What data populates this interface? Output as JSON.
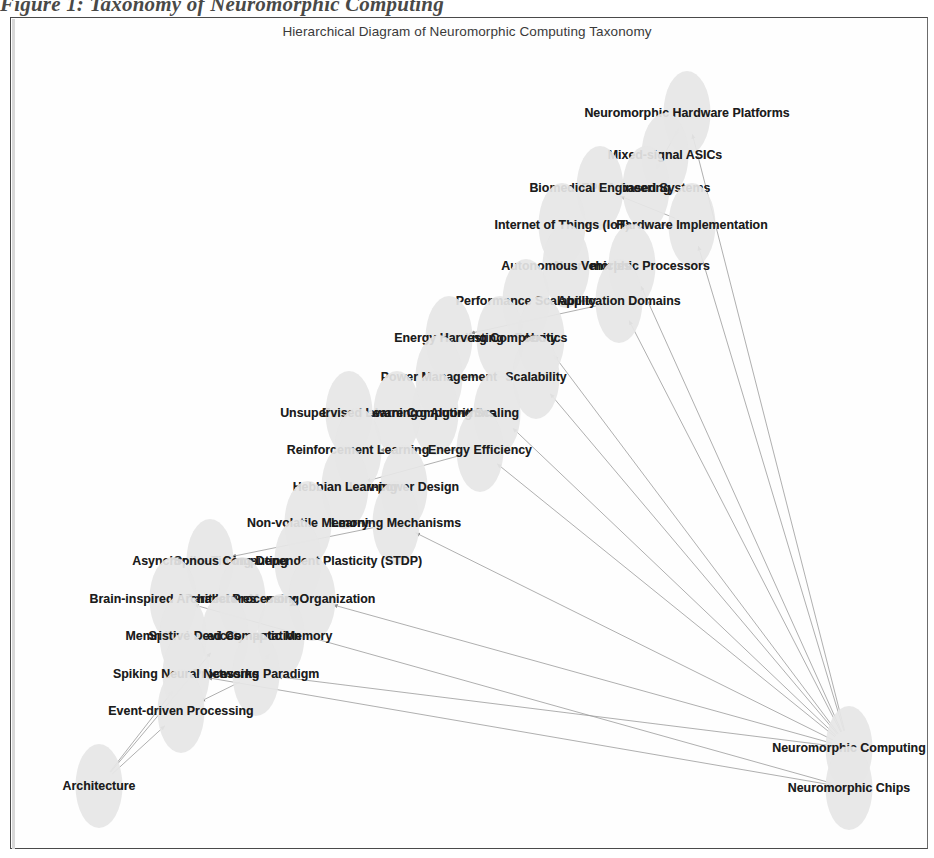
{
  "figure": {
    "caption": "Figure 1: Taxonomy of Neuromorphic Computing",
    "plot_title": "Hierarchical Diagram of Neuromorphic Computing Taxonomy"
  },
  "colors": {
    "node_fill": "#e6e6e6",
    "label_text": "#1c1c1c",
    "edge_stroke": "#9a9a9a",
    "frame_border": "#4a4a4a",
    "background": "#ffffff",
    "title_text": "#3a3a3a"
  },
  "graph": {
    "type": "hierarchical-node-link-diagram",
    "node_count": 35,
    "edge_count": 33,
    "root_nodes": [
      "Neuromorphic Computing",
      "Neuromorphic Chips",
      "Architecture"
    ],
    "nodes": [
      {
        "id": "n0",
        "label": "Neuromorphic Hardware Platforms",
        "x": 676,
        "y": 95,
        "ex": 47,
        "ey": 84
      },
      {
        "id": "n1",
        "label": "Mixed-signal ASICs",
        "x": 654,
        "y": 137,
        "ex": 47,
        "ey": 84
      },
      {
        "id": "n2",
        "label": "FPGA-based Systems",
        "x": 635,
        "y": 170,
        "ex": 47,
        "ey": 84
      },
      {
        "id": "n3",
        "label": "Biomedical Engineering",
        "x": 589,
        "y": 170,
        "ex": 47,
        "ey": 84
      },
      {
        "id": "n4",
        "label": "Hardware Implementation",
        "x": 681,
        "y": 207,
        "ex": 47,
        "ey": 84
      },
      {
        "id": "n5",
        "label": "Internet of Things (IoT)",
        "x": 551,
        "y": 207,
        "ex": 47,
        "ey": 84
      },
      {
        "id": "n6",
        "label": "Neuromorphic Processors",
        "x": 621,
        "y": 248,
        "ex": 47,
        "ey": 84
      },
      {
        "id": "n7",
        "label": "Autonomous Vehicles",
        "x": 555,
        "y": 248,
        "ex": 47,
        "ey": 84
      },
      {
        "id": "n8",
        "label": "Application Domains",
        "x": 608,
        "y": 283,
        "ex": 47,
        "ey": 84
      },
      {
        "id": "n9",
        "label": "Performance Scalability",
        "x": 515,
        "y": 283,
        "ex": 47,
        "ey": 84
      },
      {
        "id": "n10",
        "label": "Robotics",
        "x": 530,
        "y": 320,
        "ex": 47,
        "ey": 84
      },
      {
        "id": "n11",
        "label": "Scaling Complexity",
        "x": 489,
        "y": 320,
        "ex": 47,
        "ey": 84
      },
      {
        "id": "n12",
        "label": "Energy Harvesting",
        "x": 438,
        "y": 320,
        "ex": 47,
        "ey": 84
      },
      {
        "id": "n13",
        "label": "Scalability",
        "x": 525,
        "y": 359,
        "ex": 47,
        "ey": 84
      },
      {
        "id": "n14",
        "label": "Power Management",
        "x": 428,
        "y": 359,
        "ex": 47,
        "ey": 84
      },
      {
        "id": "n15",
        "label": "Scaling",
        "x": 486,
        "y": 395,
        "ex": 47,
        "ey": 84
      },
      {
        "id": "n16",
        "label": "Learning Algorithms",
        "x": 424,
        "y": 395,
        "ex": 47,
        "ey": 84
      },
      {
        "id": "n17",
        "label": "Energy-aware Computing",
        "x": 386,
        "y": 395,
        "ex": 47,
        "ey": 84
      },
      {
        "id": "n18",
        "label": "Unsupervised Learning",
        "x": 338,
        "y": 395,
        "ex": 47,
        "ey": 84
      },
      {
        "id": "n19",
        "label": "Energy Efficiency",
        "x": 469,
        "y": 432,
        "ex": 47,
        "ey": 84
      },
      {
        "id": "n20",
        "label": "Reinforcement Learning",
        "x": 347,
        "y": 432,
        "ex": 47,
        "ey": 84
      },
      {
        "id": "n21",
        "label": "Low-power Design",
        "x": 393,
        "y": 469,
        "ex": 47,
        "ey": 84
      },
      {
        "id": "n22",
        "label": "Hebbian Learning",
        "x": 334,
        "y": 469,
        "ex": 47,
        "ey": 84
      },
      {
        "id": "n23",
        "label": "Learning Mechanisms",
        "x": 385,
        "y": 505,
        "ex": 47,
        "ey": 84
      },
      {
        "id": "n24",
        "label": "Non-volatile Memory",
        "x": 297,
        "y": 505,
        "ex": 47,
        "ey": 84
      },
      {
        "id": "n25",
        "label": "Spike-Timing-Dependent Plasticity (STDP)",
        "x": 287,
        "y": 543,
        "ex": 47,
        "ey": 84
      },
      {
        "id": "n26",
        "label": "Asynchronous Computing",
        "x": 199,
        "y": 543,
        "ex": 47,
        "ey": 84
      },
      {
        "id": "n27",
        "label": "Memory Organization",
        "x": 301,
        "y": 581,
        "ex": 47,
        "ey": 84
      },
      {
        "id": "n28",
        "label": "Parallel Processing",
        "x": 231,
        "y": 581,
        "ex": 47,
        "ey": 84
      },
      {
        "id": "n29",
        "label": "Brain-inspired Architectures",
        "x": 162,
        "y": 581,
        "ex": 47,
        "ey": 84
      },
      {
        "id": "n30",
        "label": "Synaptic Memory",
        "x": 270,
        "y": 618,
        "ex": 47,
        "ey": 84
      },
      {
        "id": "n31",
        "label": "Spike-based Computation",
        "x": 214,
        "y": 618,
        "ex": 47,
        "ey": 84
      },
      {
        "id": "n32",
        "label": "Memristive Devices",
        "x": 172,
        "y": 618,
        "ex": 47,
        "ey": 84
      },
      {
        "id": "n33",
        "label": "Processing Paradigm",
        "x": 245,
        "y": 656,
        "ex": 47,
        "ey": 84
      },
      {
        "id": "n34",
        "label": "Spiking Neural Networks",
        "x": 175,
        "y": 656,
        "ex": 47,
        "ey": 84
      },
      {
        "id": "n35",
        "label": "Event-driven Processing",
        "x": 170,
        "y": 693,
        "ex": 47,
        "ey": 84
      },
      {
        "id": "n36",
        "label": "Neuromorphic Computing",
        "x": 838,
        "y": 730,
        "ex": 47,
        "ey": 84
      },
      {
        "id": "n37",
        "label": "Neuromorphic Chips",
        "x": 838,
        "y": 770,
        "ex": 47,
        "ey": 84
      },
      {
        "id": "n38",
        "label": "Architecture",
        "x": 88,
        "y": 768,
        "ex": 47,
        "ey": 84
      }
    ],
    "edges": [
      {
        "from": "n36",
        "to": "n0"
      },
      {
        "from": "n36",
        "to": "n4"
      },
      {
        "from": "n36",
        "to": "n6"
      },
      {
        "from": "n36",
        "to": "n8"
      },
      {
        "from": "n36",
        "to": "n10"
      },
      {
        "from": "n36",
        "to": "n13"
      },
      {
        "from": "n36",
        "to": "n15"
      },
      {
        "from": "n36",
        "to": "n19"
      },
      {
        "from": "n36",
        "to": "n23"
      },
      {
        "from": "n36",
        "to": "n27"
      },
      {
        "from": "n36",
        "to": "n33"
      },
      {
        "from": "n37",
        "to": "n29"
      },
      {
        "from": "n37",
        "to": "n34"
      },
      {
        "from": "n38",
        "to": "n34"
      },
      {
        "from": "n38",
        "to": "n35"
      },
      {
        "from": "n38",
        "to": "n31"
      },
      {
        "from": "n0",
        "to": "n1"
      },
      {
        "from": "n0",
        "to": "n2"
      },
      {
        "from": "n4",
        "to": "n5"
      },
      {
        "from": "n4",
        "to": "n3"
      },
      {
        "from": "n6",
        "to": "n7"
      },
      {
        "from": "n8",
        "to": "n9"
      },
      {
        "from": "n8",
        "to": "n12"
      },
      {
        "from": "n13",
        "to": "n14"
      },
      {
        "from": "n15",
        "to": "n16"
      },
      {
        "from": "n15",
        "to": "n18"
      },
      {
        "from": "n19",
        "to": "n20"
      },
      {
        "from": "n19",
        "to": "n22"
      },
      {
        "from": "n23",
        "to": "n24"
      },
      {
        "from": "n23",
        "to": "n26"
      },
      {
        "from": "n27",
        "to": "n28"
      },
      {
        "from": "n33",
        "to": "n35"
      },
      {
        "from": "n33",
        "to": "n30"
      }
    ]
  }
}
